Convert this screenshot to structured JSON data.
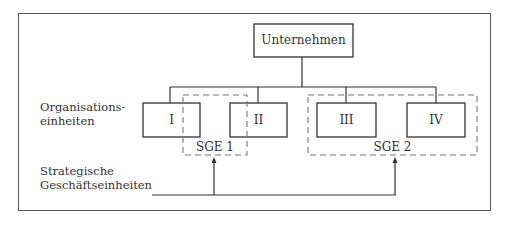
{
  "diagram": {
    "top_node": {
      "label": "Unternehmen"
    },
    "units": [
      {
        "label": "I"
      },
      {
        "label": "II"
      },
      {
        "label": "III"
      },
      {
        "label": "IV"
      }
    ],
    "groups": [
      {
        "label": "SGE 1",
        "members": [
          "I",
          "II"
        ]
      },
      {
        "label": "SGE 2",
        "members": [
          "III",
          "IV"
        ]
      }
    ],
    "side_labels": {
      "org_line1": "Organisations-",
      "org_line2": "einheiten",
      "sge_line1": "Strategische",
      "sge_line2": "Geschäftseinheiten"
    },
    "colors": {
      "line": "#333333",
      "dashed": "#777777",
      "background": "#ffffff"
    }
  }
}
